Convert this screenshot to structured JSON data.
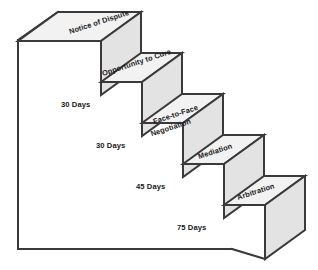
{
  "diagram": {
    "type": "isometric-staircase",
    "colors": {
      "top_face": "#f2f2f2",
      "front_face": "#e3e3e3",
      "side_face": "#ededed",
      "outline": "#3a3a3a",
      "text": "#1a1a1a",
      "background": "#ffffff"
    },
    "steps": [
      {
        "id": "notice-of-dispute",
        "label": "Notice of Dispute",
        "label_line_1": "Notice of Dispute",
        "label_line_2": "",
        "order": 1
      },
      {
        "id": "opportunity-to-cure",
        "label": "Opportunity to Cure",
        "label_line_1": "Opportunity to Cure",
        "label_line_2": "",
        "order": 2
      },
      {
        "id": "face-to-face-negotiation",
        "label": "Face-to-Face Negotiation",
        "label_line_1": "Face-to-Face",
        "label_line_2": "Negotiation",
        "order": 3
      },
      {
        "id": "mediation",
        "label": "Mediation",
        "label_line_1": "Mediation",
        "label_line_2": "",
        "order": 4
      },
      {
        "id": "arbitration",
        "label": "Arbitration",
        "label_line_1": "Arbitration",
        "label_line_2": "",
        "order": 5
      }
    ],
    "intervals": [
      {
        "id": "interval-1",
        "label": "30 Days",
        "days": 30,
        "between": [
          "notice-of-dispute",
          "opportunity-to-cure"
        ]
      },
      {
        "id": "interval-2",
        "label": "30 Days",
        "days": 30,
        "between": [
          "opportunity-to-cure",
          "face-to-face-negotiation"
        ]
      },
      {
        "id": "interval-3",
        "label": "45 Days",
        "days": 45,
        "between": [
          "face-to-face-negotiation",
          "mediation"
        ]
      },
      {
        "id": "interval-4",
        "label": "75 Days",
        "days": 75,
        "between": [
          "mediation",
          "arbitration"
        ]
      }
    ]
  }
}
